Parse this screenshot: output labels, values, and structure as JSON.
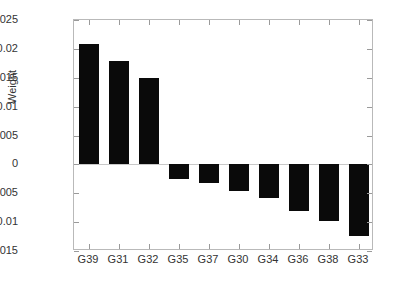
{
  "chart_data": {
    "type": "bar",
    "title": "",
    "xlabel": "",
    "ylabel": "Weight",
    "categories": [
      "G39",
      "G31",
      "G32",
      "G35",
      "G37",
      "G30",
      "G34",
      "G36",
      "G38",
      "G33"
    ],
    "values": [
      0.0209,
      0.0179,
      0.015,
      -0.0025,
      -0.0032,
      -0.0046,
      -0.0058,
      -0.008,
      -0.0098,
      -0.0124
    ],
    "ylim": [
      -0.015,
      0.025
    ],
    "ytick_labels": [
      "0.025",
      "0.02",
      "0.015",
      "0.01",
      "0.005",
      "0",
      "-0.005",
      "-0.01",
      "-0.015"
    ],
    "ytick_values": [
      0.025,
      0.02,
      0.015,
      0.01,
      0.005,
      0,
      -0.005,
      -0.01,
      -0.015
    ],
    "grid": false,
    "legend": null,
    "bar_color": "#0a0a0a",
    "axis_color": "#b9b9b9"
  }
}
